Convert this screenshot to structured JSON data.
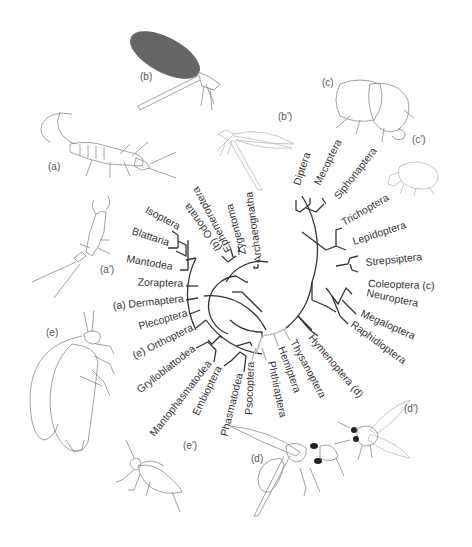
{
  "figure": {
    "type": "phylogenetic tree (circular cladogram) of insect orders with illustrations",
    "branch_color": "#333333",
    "paraneoptera_branch_color": "#b5b5b5",
    "background": "#ffffff"
  },
  "taxa": {
    "archaeognatha": "Archaeognatha",
    "zygentoma": "Zygentoma",
    "ephemeroptera": "Ephemeroptera",
    "odonata": "(b) Odonata",
    "isoptera": "Isoptera",
    "blattaria": "Blattaria",
    "mantodea": "Mantodea",
    "zoraptera": "Zoraptera",
    "dermaptera": "(a) Dermaptera",
    "plecoptera": "Plecoptera",
    "orthoptera": "(e) Orthoptera",
    "grylloblattodea": "Grylloblattodea",
    "mantophasmatodea": "Mantophasmatodea",
    "embioptera": "Embioptera",
    "phasmatodea": "Phasmatodea",
    "psocoptera": "Psocoptera",
    "phthiraptera": "Phthiraptera",
    "hemiptera": "Hemiptera",
    "thysanoptera": "Thysanoptera",
    "hymenoptera": "Hymenoptera (d)",
    "raphidioptera": "Raphidioptera",
    "megaloptera": "Megaloptera",
    "neuroptera": "Neuroptera",
    "coleoptera": "Coleoptera (c)",
    "strepsiptera": "Strepsiptera",
    "lepidoptera": "Lepidoptera",
    "trichoptera": "Trichoptera",
    "siphonaptera": "Siphonaptera",
    "mecoptera": "Mecoptera",
    "diptera": "Diptera"
  },
  "illustrations": {
    "a": "(a)",
    "a_prime": "(a')",
    "b": "(b)",
    "b_prime": "(b')",
    "c": "(c)",
    "c_prime": "(c')",
    "d": "(d)",
    "d_prime": "(d')",
    "e": "(e)",
    "e_prime": "(e')"
  }
}
